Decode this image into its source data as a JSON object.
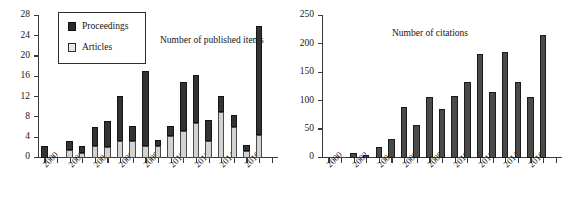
{
  "chart_data": [
    {
      "id": "published",
      "type": "bar",
      "stacked": true,
      "title": "Number of published items",
      "xlabel": "",
      "ylabel": "",
      "ylim": [
        0,
        28
      ],
      "ytick_step": 4,
      "yticks": [
        0,
        4,
        8,
        12,
        16,
        20,
        24,
        28
      ],
      "ytick_labels": [
        "0",
        "4",
        "8",
        "12",
        "16",
        "20",
        "24",
        "28"
      ],
      "grid": false,
      "legend_position": "upper-left",
      "categories": [
        2000,
        2001,
        2002,
        2003,
        2004,
        2005,
        2006,
        2007,
        2008,
        2009,
        2010,
        2011,
        2012,
        2013,
        2014,
        2015,
        2016,
        2017,
        2018
      ],
      "xtick_labels": [
        "2000",
        "2002",
        "2004",
        "2006",
        "2008",
        "2010",
        "2012",
        "2014",
        "2016"
      ],
      "xtick_years": [
        2000,
        2002,
        2004,
        2006,
        2008,
        2010,
        2012,
        2014,
        2016
      ],
      "series": [
        {
          "name": "Articles",
          "color": "#d2d2d2",
          "values": [
            0,
            0,
            1.6,
            1,
            2.3,
            2.2,
            3.3,
            3.4,
            2.3,
            2.4,
            4.3,
            5.4,
            7,
            3.4,
            9.1,
            6.1,
            1.3,
            4.5,
            0
          ]
        },
        {
          "name": "Proceedings",
          "color": "#333333",
          "values": [
            2.4,
            0,
            1.8,
            1.4,
            3.9,
            5.1,
            8.9,
            2.9,
            14.9,
            1.1,
            2,
            9.6,
            9.3,
            4.1,
            3.2,
            2.3,
            1.3,
            21.5,
            0
          ]
        }
      ],
      "totals": [
        2.4,
        0,
        3.4,
        2.4,
        6.2,
        7.3,
        12.2,
        6.3,
        17.2,
        3.5,
        6.3,
        15,
        16.3,
        7.5,
        12.3,
        8.4,
        2.6,
        26,
        0
      ]
    },
    {
      "id": "citations",
      "type": "bar",
      "stacked": false,
      "title": "Number of citations",
      "xlabel": "",
      "ylabel": "",
      "ylim": [
        0,
        250
      ],
      "ytick_step": 50,
      "yticks": [
        0,
        50,
        100,
        150,
        200,
        250
      ],
      "ytick_labels": [
        "0",
        "50",
        "100",
        "150",
        "200",
        "250"
      ],
      "grid": false,
      "categories": [
        2000,
        2001,
        2002,
        2003,
        2004,
        2005,
        2006,
        2007,
        2008,
        2009,
        2010,
        2011,
        2012,
        2013,
        2014,
        2015,
        2016,
        2017,
        2018
      ],
      "xtick_labels": [
        "2000",
        "2002",
        "2004",
        "2006",
        "2008",
        "2010",
        "2012",
        "2014",
        "2016"
      ],
      "xtick_years": [
        2000,
        2002,
        2004,
        2006,
        2008,
        2010,
        2012,
        2014,
        2016
      ],
      "series": [
        {
          "name": "Citations",
          "color": "#4a4a4a",
          "values": [
            0,
            0,
            9,
            6,
            19,
            34,
            89,
            58,
            107,
            86,
            110,
            133,
            183,
            116,
            186,
            133,
            107,
            216,
            0
          ]
        }
      ]
    }
  ]
}
